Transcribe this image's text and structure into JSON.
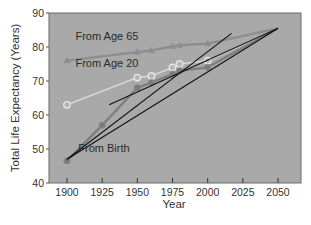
{
  "chart_data": {
    "type": "line",
    "title": "",
    "xlabel": "Year",
    "ylabel": "Total Life Expectancy (Years)",
    "xlim": [
      1887,
      2067
    ],
    "ylim": [
      40,
      90
    ],
    "xticks": [
      1900,
      1925,
      1950,
      1975,
      2000,
      2025,
      2050
    ],
    "yticks": [
      40,
      50,
      60,
      70,
      80,
      90
    ],
    "grid": false,
    "legend_position": "inline labels",
    "background": "#a9a9a9",
    "series": [
      {
        "name": "From Age 65",
        "marker": "triangle",
        "color": "#8d8d8d",
        "x": [
          1900,
          1950,
          1960,
          1975,
          1980,
          2000,
          2050
        ],
        "values": [
          76,
          78.5,
          79,
          80.2,
          80.5,
          81,
          85.5
        ]
      },
      {
        "name": "From Age 20",
        "marker": "open-circle",
        "color": "#d6d6d6",
        "x": [
          1900,
          1950,
          1960,
          1975,
          1980,
          2000,
          2050
        ],
        "values": [
          63,
          71,
          71.5,
          74,
          75,
          76,
          85.5
        ]
      },
      {
        "name": "From Birth",
        "marker": "filled-circle",
        "color": "#7f7f7f",
        "x": [
          1900,
          1925,
          1950,
          1960,
          1975,
          1980,
          2000,
          2050
        ],
        "values": [
          46.5,
          57,
          68,
          69.5,
          72,
          73,
          74,
          85.5
        ]
      }
    ],
    "trend_lines": [
      {
        "name": "trend-birth-long",
        "x": [
          1900,
          2050
        ],
        "values": [
          47,
          85.5
        ],
        "color": "#111111"
      },
      {
        "name": "trend-birth-steep",
        "x": [
          1900,
          2017
        ],
        "values": [
          47,
          84
        ],
        "color": "#111111"
      },
      {
        "name": "trend-age20",
        "x": [
          1930,
          2050
        ],
        "values": [
          63,
          85.5
        ],
        "color": "#111111"
      }
    ],
    "annotations": [
      {
        "text": "From Age 65",
        "x": 1906,
        "y": 82
      },
      {
        "text": "From Age 20",
        "x": 1906,
        "y": 74
      },
      {
        "text": "From Birth",
        "x": 1908,
        "y": 49
      }
    ]
  }
}
